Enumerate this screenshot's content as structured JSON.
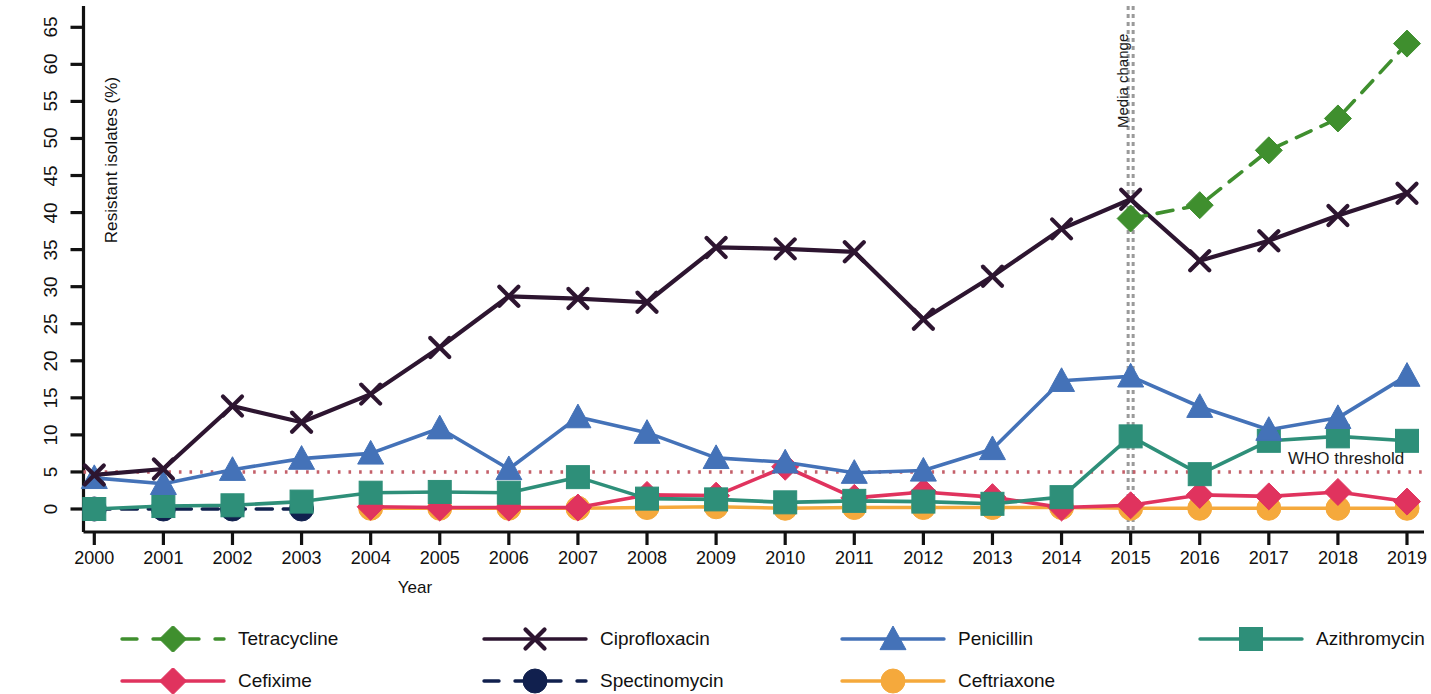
{
  "chart_data": {
    "type": "line",
    "title": "",
    "xlabel": "Year",
    "ylabel": "Resistant isolates (%)",
    "x": [
      2000,
      2001,
      2002,
      2003,
      2004,
      2005,
      2006,
      2007,
      2008,
      2009,
      2010,
      2011,
      2012,
      2013,
      2014,
      2015,
      2016,
      2017,
      2018,
      2019
    ],
    "xticklabels": [
      "2000",
      "2001",
      "2002",
      "2003",
      "2004",
      "2005",
      "2006",
      "2007",
      "2008",
      "2009",
      "2010",
      "2011",
      "2012",
      "2013",
      "2014",
      "2015",
      "2016",
      "2017",
      "2018",
      "2019"
    ],
    "yticklabels": [
      "0",
      "5",
      "10",
      "15",
      "20",
      "25",
      "30",
      "35",
      "40",
      "45",
      "50",
      "55",
      "60",
      "65"
    ],
    "ylim": [
      0,
      67
    ],
    "xlim": [
      1999.65,
      2019.35
    ],
    "grid": false,
    "legend_position": "bottom",
    "series": [
      {
        "name": "Tetracycline",
        "color": "#3f8f2e",
        "marker": "diamond",
        "linestyle": "dashed",
        "x": [
          2015,
          2016,
          2017,
          2018,
          2019
        ],
        "values": [
          39.2,
          41.0,
          48.4,
          52.7,
          62.8
        ]
      },
      {
        "name": "Ciprofloxacin",
        "color": "#2d1530",
        "marker": "x",
        "linestyle": "solid",
        "x": [
          2000,
          2001,
          2002,
          2003,
          2004,
          2005,
          2006,
          2007,
          2008,
          2009,
          2010,
          2011,
          2012,
          2013,
          2014,
          2015,
          2016,
          2017,
          2018,
          2019
        ],
        "values": [
          4.6,
          5.4,
          13.9,
          11.7,
          15.5,
          21.8,
          28.7,
          28.4,
          27.9,
          35.3,
          35.1,
          34.7,
          25.6,
          31.4,
          37.8,
          41.8,
          33.5,
          36.2,
          39.6,
          42.6
        ]
      },
      {
        "name": "Penicillin",
        "color": "#4472b8",
        "marker": "triangle",
        "linestyle": "solid",
        "x": [
          2000,
          2001,
          2002,
          2003,
          2004,
          2005,
          2006,
          2007,
          2008,
          2009,
          2010,
          2011,
          2012,
          2013,
          2014,
          2015,
          2016,
          2017,
          2018,
          2019
        ],
        "values": [
          4.2,
          3.4,
          5.3,
          6.8,
          7.5,
          10.9,
          5.4,
          12.4,
          10.3,
          6.9,
          6.3,
          4.9,
          5.2,
          8.1,
          17.3,
          17.9,
          13.8,
          10.7,
          12.3,
          18.0
        ]
      },
      {
        "name": "Azithromycin",
        "color": "#2e8f79",
        "marker": "square",
        "linestyle": "solid",
        "x": [
          2000,
          2001,
          2002,
          2003,
          2004,
          2005,
          2006,
          2007,
          2008,
          2009,
          2010,
          2011,
          2012,
          2013,
          2014,
          2015,
          2016,
          2017,
          2018,
          2019
        ],
        "values": [
          0.0,
          0.4,
          0.5,
          1.0,
          2.2,
          2.3,
          2.2,
          4.3,
          1.4,
          1.3,
          0.9,
          1.1,
          1.0,
          0.7,
          1.6,
          9.8,
          4.7,
          9.2,
          9.8,
          9.2
        ]
      },
      {
        "name": "Cefixime",
        "color": "#e0335e",
        "marker": "diamond",
        "linestyle": "solid",
        "x": [
          2004,
          2005,
          2006,
          2007,
          2008,
          2009,
          2010,
          2011,
          2012,
          2013,
          2014,
          2015,
          2016,
          2017,
          2018,
          2019
        ],
        "values": [
          0.3,
          0.2,
          0.2,
          0.2,
          1.9,
          1.8,
          5.7,
          1.5,
          2.3,
          1.6,
          0.2,
          0.5,
          1.9,
          1.7,
          2.3,
          1.0
        ]
      },
      {
        "name": "Spectinomycin",
        "color": "#11204e",
        "marker": "circle",
        "linestyle": "dashed",
        "x": [
          2000,
          2001,
          2002,
          2003
        ],
        "values": [
          0.0,
          0.0,
          0.0,
          0.0
        ]
      },
      {
        "name": "Ceftriaxone",
        "color": "#f5a93c",
        "marker": "circle",
        "linestyle": "solid",
        "x": [
          2004,
          2005,
          2006,
          2007,
          2008,
          2009,
          2010,
          2011,
          2012,
          2013,
          2014,
          2015,
          2016,
          2017,
          2018,
          2019
        ],
        "values": [
          0.1,
          0.1,
          0.1,
          0.1,
          0.2,
          0.3,
          0.1,
          0.2,
          0.2,
          0.2,
          0.2,
          0.1,
          0.1,
          0.1,
          0.1,
          0.1
        ]
      }
    ],
    "annotations": [
      {
        "id": "media-change",
        "label": "Media change",
        "type": "vline",
        "x": 2015,
        "color": "#9a9a9a",
        "linestyle": "dotted"
      },
      {
        "id": "who-threshold",
        "label": "WHO threshold",
        "type": "hline",
        "y": 5,
        "color": "#c4606a",
        "linestyle": "dotted"
      }
    ]
  },
  "legend": {
    "items": [
      {
        "label": "Tetracycline",
        "color": "#3f8f2e",
        "marker": "diamond",
        "linestyle": "dashed"
      },
      {
        "label": "Ciprofloxacin",
        "color": "#2d1530",
        "marker": "x",
        "linestyle": "solid"
      },
      {
        "label": "Penicillin",
        "color": "#4472b8",
        "marker": "triangle",
        "linestyle": "solid"
      },
      {
        "label": "Azithromycin",
        "color": "#2e8f79",
        "marker": "square",
        "linestyle": "solid"
      },
      {
        "label": "Cefixime",
        "color": "#e0335e",
        "marker": "diamond",
        "linestyle": "solid"
      },
      {
        "label": "Spectinomycin",
        "color": "#11204e",
        "marker": "circle",
        "linestyle": "dashed"
      },
      {
        "label": "Ceftriaxone",
        "color": "#f5a93c",
        "marker": "circle",
        "linestyle": "solid"
      }
    ]
  }
}
